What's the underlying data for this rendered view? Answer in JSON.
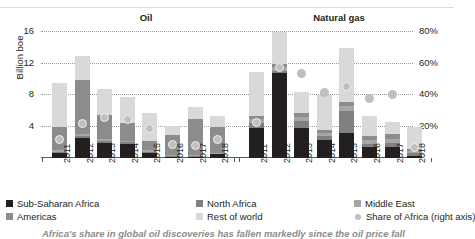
{
  "panels": {
    "oil_title": "Oil",
    "gas_title": "Natural gas"
  },
  "axes": {
    "y_left_title": "Billion boe",
    "y_left_ticks": [
      "16",
      "12",
      "8",
      "4"
    ],
    "y_right_ticks": [
      "80%",
      "60%",
      "40%",
      "20%"
    ],
    "y_left_range": [
      0,
      18
    ],
    "y_right_range": [
      0,
      90
    ]
  },
  "legend": [
    {
      "label": "Sub-Saharan Africa",
      "color": "#231f20",
      "shape": "square"
    },
    {
      "label": "North Africa",
      "color": "#808080",
      "shape": "square"
    },
    {
      "label": "Middle East",
      "color": "#a6a6a6",
      "shape": "square"
    },
    {
      "label": "Americas",
      "color": "#8c8c8c",
      "shape": "square"
    },
    {
      "label": "Rest of world",
      "color": "#d9d9d9",
      "shape": "square"
    },
    {
      "label": "Share of Africa (right axis)",
      "color": "#bfbfbf",
      "shape": "circle"
    }
  ],
  "caption": "Africa's share in global oil discoveries has fallen markedly since the oil price fall",
  "chart_data": {
    "type": "bar",
    "title": "",
    "subtitle": "",
    "xlabel": "",
    "ylabel": "Billion boe",
    "y2label": "Share of Africa (right axis)",
    "ylim": [
      0,
      18
    ],
    "y2lim": [
      0,
      90
    ],
    "grid": true,
    "legend_position": "bottom",
    "stacked": true,
    "panels": [
      {
        "name": "Oil",
        "categories": [
          "2011",
          "2012",
          "2013",
          "2014",
          "2015",
          "2016",
          "2017",
          "2018"
        ],
        "series": [
          {
            "name": "Sub-Saharan Africa",
            "color": "#231f20",
            "values": [
              0.6,
              2.6,
              1.9,
              1.8,
              0.6,
              0.2,
              0.2,
              0.5
            ]
          },
          {
            "name": "North Africa",
            "color": "#808080",
            "values": [
              0.2,
              0.2,
              0.3,
              0.2,
              0.2,
              0.1,
              0.1,
              0.1
            ]
          },
          {
            "name": "Middle East",
            "color": "#a6a6a6",
            "values": [
              0.2,
              0.2,
              0.2,
              0.2,
              0.2,
              0.1,
              0.1,
              0.1
            ]
          },
          {
            "name": "Americas",
            "color": "#8c8c8c",
            "values": [
              2.9,
              6.9,
              3.0,
              2.3,
              1.2,
              2.5,
              4.6,
              3.2
            ]
          },
          {
            "name": "Rest of world",
            "color": "#d9d9d9",
            "values": [
              5.6,
              3.1,
              3.4,
              3.2,
              3.5,
              1.2,
              1.5,
              1.4
            ]
          }
        ],
        "totals": [
          9.5,
          13.0,
          8.8,
          7.7,
          5.7,
          4.1,
          6.5,
          5.3
        ],
        "share_of_africa_pct": [
          11,
          21,
          25,
          24,
          18,
          8,
          7,
          11
        ]
      },
      {
        "name": "Natural gas",
        "categories": [
          "2011",
          "2012",
          "2013",
          "2014",
          "2015",
          "2016",
          "2017",
          "2018"
        ],
        "series": [
          {
            "name": "Sub-Saharan Africa",
            "color": "#231f20",
            "values": [
              3.8,
              10.8,
              3.8,
              2.3,
              3.2,
              1.4,
              1.4,
              0.2
            ]
          },
          {
            "name": "North Africa",
            "color": "#808080",
            "values": [
              0.6,
              0.3,
              0.9,
              0.5,
              2.8,
              0.4,
              0.5,
              0.4
            ]
          },
          {
            "name": "Middle East",
            "color": "#a6a6a6",
            "values": [
              0.5,
              0.4,
              0.5,
              0.4,
              0.6,
              0.5,
              0.5,
              0.3
            ]
          },
          {
            "name": "Americas",
            "color": "#8c8c8c",
            "values": [
              0.4,
              0.5,
              0.5,
              0.4,
              0.5,
              0.5,
              0.6,
              0.2
            ]
          },
          {
            "name": "Rest of world",
            "color": "#d9d9d9",
            "values": [
              5.6,
              4.0,
              2.7,
              4.4,
              6.9,
              2.5,
              1.6,
              2.9
            ]
          }
        ],
        "totals": [
          10.9,
          16.0,
          8.4,
          8.0,
          14.0,
          5.3,
          4.6,
          4.0
        ],
        "share_of_africa_pct": [
          22,
          57,
          53,
          41,
          45,
          37,
          40,
          6
        ]
      }
    ]
  }
}
